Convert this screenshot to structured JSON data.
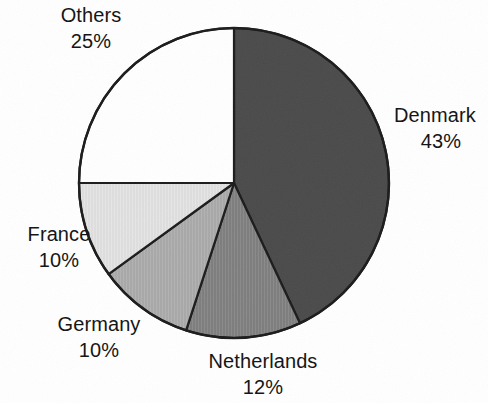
{
  "chart_data": {
    "type": "pie",
    "title": "",
    "subtitle": "",
    "xlabel": "",
    "ylabel": "",
    "legend_position": "none",
    "grid": false,
    "label_format": "name above percent",
    "start_angle_deg": 0,
    "direction": "clockwise",
    "categories": [
      "Denmark",
      "Netherlands",
      "Germany",
      "France",
      "Others"
    ],
    "values": [
      43,
      12,
      10,
      10,
      25
    ],
    "unit": "%",
    "slices": [
      {
        "label": "Denmark",
        "percent_text": "43%",
        "value": 43,
        "color": "#4a4a4a",
        "fill_description": "dark gray",
        "start_deg": 0,
        "end_deg": 154.8
      },
      {
        "label": "Netherlands",
        "percent_text": "12%",
        "value": 12,
        "color": "#7d7d7d",
        "fill_description": "medium gray",
        "start_deg": 154.8,
        "end_deg": 198.0
      },
      {
        "label": "Germany",
        "percent_text": "10%",
        "value": 10,
        "color": "#a8a8a8",
        "fill_description": "medium light gray",
        "start_deg": 198.0,
        "end_deg": 234.0
      },
      {
        "label": "France",
        "percent_text": "10%",
        "value": 10,
        "color": "#dcdcdc",
        "fill_description": "light gray",
        "start_deg": 234.0,
        "end_deg": 270.0
      },
      {
        "label": "Others",
        "percent_text": "25%",
        "value": 25,
        "color": "#ffffff",
        "fill_description": "white",
        "start_deg": 270.0,
        "end_deg": 360.0
      }
    ],
    "geometry": {
      "center_x": 234,
      "center_y": 183,
      "radius": 155
    },
    "outline_color": "#1b1b1b"
  },
  "labels": {
    "others": {
      "name": "Others",
      "value": "25%"
    },
    "denmark": {
      "name": "Denmark",
      "value": "43%"
    },
    "netherlands": {
      "name": "Netherlands",
      "value": "12%"
    },
    "germany": {
      "name": "Germany",
      "value": "10%"
    },
    "france": {
      "name": "France",
      "value": "10%"
    }
  }
}
